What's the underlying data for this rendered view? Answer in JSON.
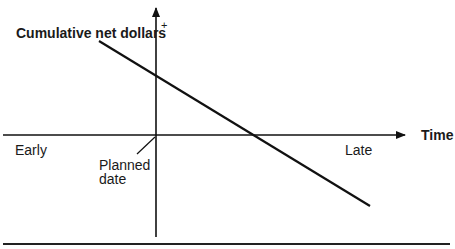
{
  "diagram": {
    "y_axis_label": "Cumulative net dollars",
    "y_axis_positive_marker": "+",
    "x_axis_label": "Time",
    "early_label": "Early",
    "late_label": "Late",
    "origin_label_line1": "Planned",
    "origin_label_line2": "date",
    "line_color": "#111111"
  }
}
